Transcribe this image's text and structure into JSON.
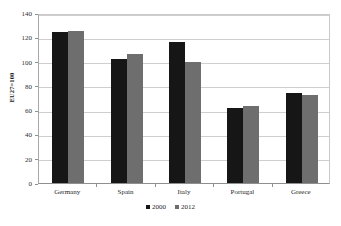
{
  "chart_data": {
    "type": "bar",
    "title": "",
    "subtitle": "",
    "xlabel": "",
    "ylabel": "EU27=100",
    "categories": [
      "Germany",
      "Spain",
      "Italy",
      "Portugal",
      "Greece"
    ],
    "series": [
      {
        "name": "2000",
        "color": "#161616",
        "values": [
          124,
          102,
          116.5,
          61.5,
          74.5
        ]
      },
      {
        "name": "2012",
        "color": "#6e6e6e",
        "values": [
          125,
          106.5,
          99.5,
          63.5,
          72.5
        ]
      }
    ],
    "ylim": [
      0,
      140
    ],
    "yticks": [
      0,
      20,
      40,
      60,
      80,
      100,
      120,
      140
    ],
    "ytick_labels": [
      "0",
      "20",
      "40",
      "60",
      "80",
      "100",
      "120",
      "140"
    ],
    "grid": true,
    "grid_axis": "y",
    "legend_position": "bottom",
    "plot_background": "#ffffff",
    "grid_color": "#cfcfcf",
    "axis_color": "#8f8f8f"
  }
}
